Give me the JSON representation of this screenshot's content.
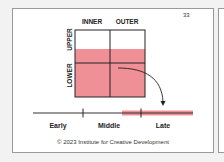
{
  "page_number": "33",
  "grid": {
    "columns": [
      "INNER",
      "OUTER"
    ],
    "rows": [
      "UPPER",
      "LOWER"
    ],
    "fill_color": "#ef8f96"
  },
  "timeline": {
    "labels": [
      "Early",
      "Middle",
      "Late"
    ],
    "highlight_color": "#ef8f96",
    "highlighted_segment": "Late"
  },
  "footer": {
    "copyright": "© 2023 Institute for Creative Development"
  }
}
